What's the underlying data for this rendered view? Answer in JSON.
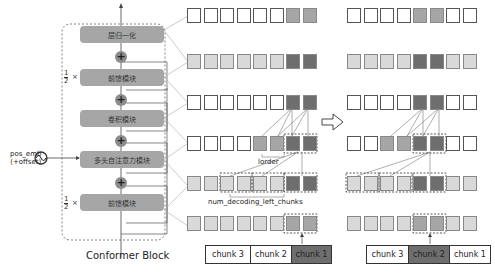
{
  "conformer": {
    "title": "Conformer Block",
    "blocks": [
      {
        "label": "层归一化",
        "scale": ""
      },
      {
        "label": "前馈模块",
        "scale": "1/2×"
      },
      {
        "label": "卷积模块",
        "scale": ""
      },
      {
        "label": "多头自注意力模块",
        "scale": ""
      },
      {
        "label": "前馈模块",
        "scale": "1/2×"
      }
    ],
    "half_num": "1",
    "half_den": "2",
    "times": "×",
    "plus": "+",
    "pos_emb_line1": "pos_emb",
    "pos_emb_line2": "(+offset)"
  },
  "annotations": {
    "lorder": "lorder",
    "num_decoding_left_chunks": "num_decoding_left_chunks"
  },
  "left_grid": {
    "rows": [
      [
        "w",
        "w",
        "w",
        "w",
        "w",
        "w",
        "m",
        "m"
      ],
      [
        "l",
        "l",
        "l",
        "l",
        "l",
        "l",
        "d",
        "d"
      ],
      [
        "w",
        "w",
        "w",
        "w",
        "w",
        "w",
        "d",
        "d"
      ],
      [
        "w",
        "w",
        "w",
        "w",
        "m",
        "m",
        "d",
        "d"
      ],
      [
        "l",
        "l",
        "l",
        "l",
        "l",
        "l",
        "d",
        "d"
      ],
      [
        "l",
        "l",
        "l",
        "l",
        "l",
        "l",
        "m",
        "m"
      ]
    ],
    "chunks": [
      {
        "label": "chunk 3",
        "active": false
      },
      {
        "label": "chunk 2",
        "active": false
      },
      {
        "label": "chunk 1",
        "active": true
      }
    ]
  },
  "right_grid": {
    "rows": [
      [
        "w",
        "w",
        "w",
        "w",
        "m",
        "m",
        "w",
        "w"
      ],
      [
        "l",
        "l",
        "l",
        "l",
        "d",
        "d",
        "l",
        "l"
      ],
      [
        "w",
        "w",
        "w",
        "w",
        "d",
        "d",
        "w",
        "w"
      ],
      [
        "w",
        "w",
        "m",
        "m",
        "d",
        "d",
        "w",
        "w"
      ],
      [
        "l",
        "l",
        "l",
        "l",
        "d",
        "d",
        "l",
        "l"
      ],
      [
        "l",
        "l",
        "l",
        "l",
        "m",
        "m",
        "l",
        "l"
      ]
    ],
    "chunks": [
      {
        "label": "chunk 3",
        "active": false
      },
      {
        "label": "chunk 2",
        "active": true
      },
      {
        "label": "chunk 1",
        "active": false
      }
    ]
  },
  "colors": {
    "white": "#ffffff",
    "light": "#d9d9d9",
    "medium": "#a6a6a6",
    "dark": "#6e6e6e",
    "active_chunk": "#6e6e6e"
  }
}
